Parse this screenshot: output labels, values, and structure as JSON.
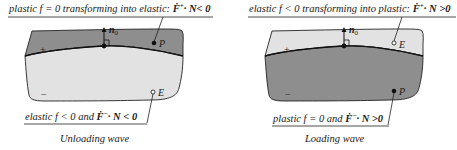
{
  "colors": {
    "dark_region": "#8e8e8e",
    "light_region": "#e2e2e2",
    "outline": "#222222",
    "text": "#1a1a1a"
  },
  "panels": [
    {
      "caption": "Unloading wave",
      "top_label": {
        "prefix": "plastic f = 0 transforming into elastic: ",
        "vector": "Ḟ",
        "sup": "+",
        "suffix": "· N< 0"
      },
      "bottom_label": {
        "prefix": "elastic f < 0 and ",
        "vector": "Ḟ",
        "sup": "−",
        "suffix": "· N < 0"
      },
      "upper_region": {
        "sign": "+",
        "shade": "dark",
        "point": "P",
        "point_style": "filled"
      },
      "lower_region": {
        "sign": "−",
        "shade": "light",
        "point": "E",
        "point_style": "hollow"
      },
      "normal_label": "n",
      "normal_sub": "0"
    },
    {
      "caption": "Loading wave",
      "top_label": {
        "prefix": "elastic f < 0 transforming into plastic: ",
        "vector": "Ḟ",
        "sup": "+",
        "suffix": "· N >0"
      },
      "bottom_label": {
        "prefix": "plastic f = 0 and ",
        "vector": "Ḟ",
        "sup": "−",
        "suffix": "· N >0"
      },
      "upper_region": {
        "sign": "+",
        "shade": "light",
        "point": "E",
        "point_style": "hollow"
      },
      "lower_region": {
        "sign": "−",
        "shade": "dark",
        "point": "P",
        "point_style": "filled"
      },
      "normal_label": "n",
      "normal_sub": "0"
    }
  ]
}
